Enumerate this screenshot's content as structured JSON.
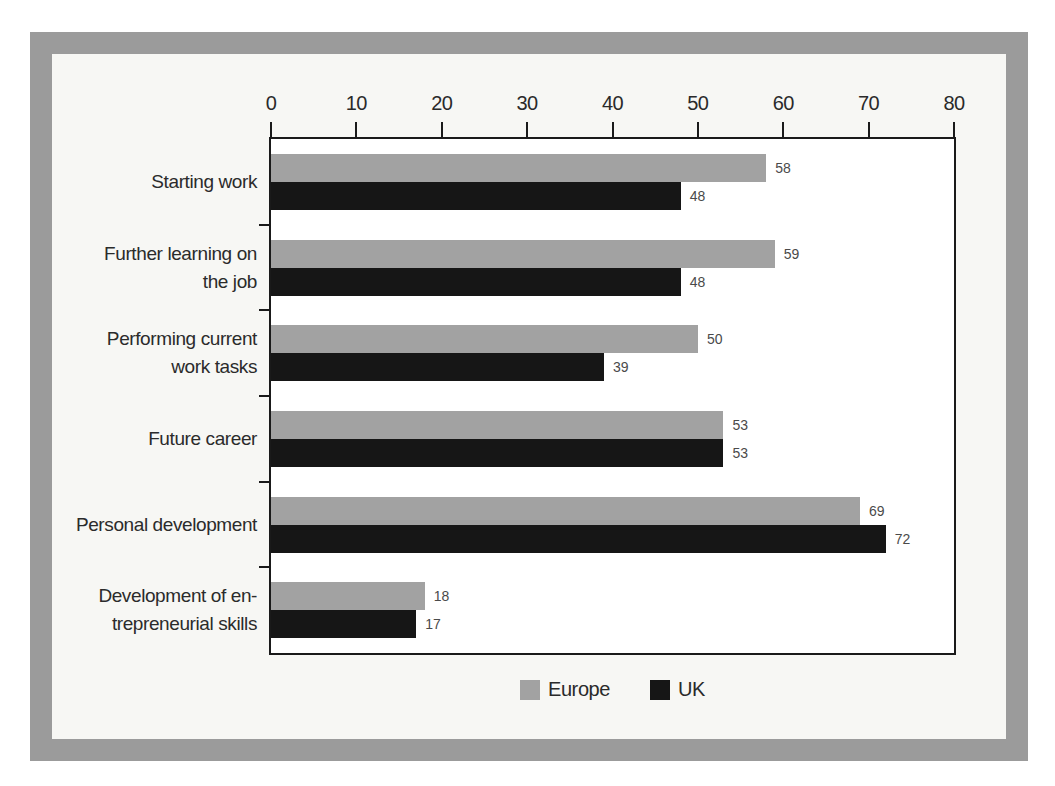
{
  "chart_data": {
    "type": "bar",
    "orientation": "horizontal",
    "title": "",
    "categories": [
      {
        "lines": [
          "Starting work"
        ]
      },
      {
        "lines": [
          "Further learning on",
          "the job"
        ]
      },
      {
        "lines": [
          "Performing current",
          "work tasks"
        ]
      },
      {
        "lines": [
          "Future career"
        ]
      },
      {
        "lines": [
          "Personal development"
        ]
      },
      {
        "lines": [
          "Development of en-",
          "trepreneurial skills"
        ]
      }
    ],
    "series": [
      {
        "name": "Europe",
        "color": "#a2a2a2",
        "values": [
          58,
          59,
          50,
          53,
          69,
          18
        ]
      },
      {
        "name": "UK",
        "color": "#161616",
        "values": [
          48,
          48,
          39,
          53,
          72,
          17
        ]
      }
    ],
    "value_labels_shown": true,
    "axis": {
      "position": "top",
      "min": 0,
      "max": 80,
      "step": 10,
      "tick_labels": [
        "0",
        "10",
        "20",
        "30",
        "40",
        "50",
        "60",
        "70",
        "80"
      ]
    },
    "legend": {
      "position": "bottom",
      "entries": [
        {
          "label": "Europe",
          "color": "#a2a2a2"
        },
        {
          "label": "UK",
          "color": "#161616"
        }
      ]
    },
    "grid": false
  },
  "colors": {
    "frame_border": "#9b9b9b",
    "panel_background": "#f7f7f4",
    "plot_background": "#ffffff",
    "plot_border": "#1a1a1a",
    "bar_europe": "#a2a2a2",
    "bar_uk": "#161616",
    "value_label_text": "#4a4a4a",
    "axis_text": "#2a2a2a"
  }
}
